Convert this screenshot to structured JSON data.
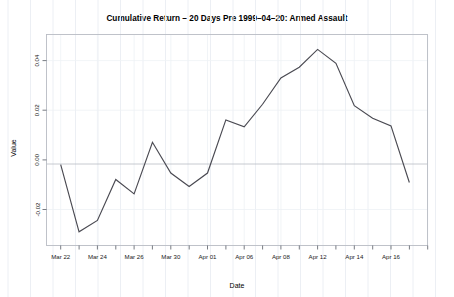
{
  "chart_data": {
    "type": "line",
    "title": "Cumulative Return – 20 Days Pre 1999–04–20: Armed Assault",
    "xlabel": "Date",
    "ylabel": "Value",
    "grid": true,
    "legend": "none",
    "line_color": "#4a4a52",
    "zero_line": 0.0,
    "xlim": [
      0,
      20
    ],
    "ylim": [
      -0.0345,
      0.0505
    ],
    "y_ticks": [
      -0.02,
      0.0,
      0.02,
      0.04
    ],
    "y_tick_labels": [
      "-0.02",
      "0.00",
      "0.02",
      "0.04"
    ],
    "x_tick_labels": [
      "Mar 22",
      "Mar 24",
      "Mar 26",
      "Mar 30",
      "Apr 01",
      "Apr 06",
      "Apr 08",
      "Apr 12",
      "Apr 14",
      "Apr 16"
    ],
    "x_tick_label_indices": [
      0,
      2,
      4,
      6,
      8,
      10,
      12,
      14,
      16,
      18
    ],
    "x_tick_count": 21,
    "x": [
      0,
      1,
      2,
      3,
      4,
      5,
      6,
      7,
      8,
      9,
      10,
      11,
      12,
      13,
      14,
      15,
      16,
      17,
      18,
      19
    ],
    "categories": [
      "Mar 22",
      "Mar 23",
      "Mar 24",
      "Mar 25",
      "Mar 26",
      "Mar 29",
      "Mar 30",
      "Mar 31",
      "Apr 01",
      "Apr 05",
      "Apr 06",
      "Apr 07",
      "Apr 08",
      "Apr 09",
      "Apr 12",
      "Apr 13",
      "Apr 14",
      "Apr 15",
      "Apr 16",
      "Apr 19"
    ],
    "values": [
      -0.0019,
      -0.029,
      -0.0244,
      -0.0079,
      -0.0137,
      0.0071,
      -0.0053,
      -0.0107,
      -0.0053,
      0.0161,
      0.0133,
      0.0224,
      0.033,
      0.0373,
      0.0445,
      0.0389,
      0.0218,
      0.0168,
      0.0137,
      -0.0091
    ],
    "series": [
      {
        "name": "Cumulative Return",
        "values": [
          -0.0019,
          -0.029,
          -0.0244,
          -0.0079,
          -0.0137,
          0.0071,
          -0.0053,
          -0.0107,
          -0.0053,
          0.0161,
          0.0133,
          0.0224,
          0.033,
          0.0373,
          0.0445,
          0.0389,
          0.0218,
          0.0168,
          0.0137,
          -0.0091
        ]
      }
    ]
  }
}
